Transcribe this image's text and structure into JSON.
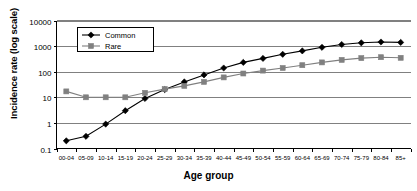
{
  "chart_data": {
    "type": "line",
    "title": "",
    "xlabel": "Age group",
    "ylabel": "Incidence rate (log scale)",
    "log_y": true,
    "ylim": [
      0.1,
      10000
    ],
    "ytick_labels": [
      "10000",
      "1000",
      "100",
      "10",
      "1",
      "0.1"
    ],
    "ytick_values": [
      10000,
      1000,
      100,
      10,
      1,
      0.1
    ],
    "grid": "horizontal",
    "legend_position": "top-left-inside",
    "categories": [
      "00-04",
      "05-09",
      "10-14",
      "15-19",
      "20-24",
      "25-29",
      "30-34",
      "35-39",
      "40-44",
      "45-49",
      "50-54",
      "55-59",
      "60-64",
      "65-69",
      "70-74",
      "75-79",
      "80-84",
      "85+"
    ],
    "series": [
      {
        "name": "Common",
        "marker": "diamond",
        "color": "#000000",
        "values": [
          0.2,
          0.3,
          0.9,
          3.0,
          9.0,
          20.0,
          40.0,
          75.0,
          140.0,
          230.0,
          330.0,
          480.0,
          650.0,
          900.0,
          1150.0,
          1350.0,
          1450.0,
          1400.0
        ]
      },
      {
        "name": "Rare",
        "marker": "square",
        "color": "#808080",
        "values": [
          17.0,
          10.0,
          10.0,
          10.0,
          15.0,
          21.0,
          28.0,
          40.0,
          60.0,
          85.0,
          110.0,
          140.0,
          180.0,
          230.0,
          290.0,
          340.0,
          370.0,
          350.0
        ]
      }
    ]
  },
  "legend": {
    "entries": [
      {
        "label": "Common"
      },
      {
        "label": "Rare"
      }
    ]
  }
}
